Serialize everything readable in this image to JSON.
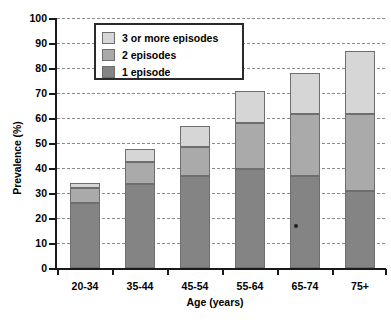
{
  "chart_data": {
    "type": "bar",
    "stacked": true,
    "title": "",
    "xlabel": "Age (years)",
    "ylabel": "Prevalence (%)",
    "categories": [
      "20-34",
      "35-44",
      "45-54",
      "55-64",
      "65-74",
      "75+"
    ],
    "ylim": [
      0,
      100
    ],
    "yticks": [
      0,
      10,
      20,
      30,
      40,
      50,
      60,
      70,
      80,
      90,
      100
    ],
    "grid": true,
    "legend_position": "top-left-inside",
    "series": [
      {
        "name": "1 episode",
        "color": "#848484",
        "values": [
          26.0,
          33.5,
          37.0,
          39.5,
          37.0,
          31.0
        ]
      },
      {
        "name": "2 episodes",
        "color": "#aaaaaa",
        "values": [
          6.0,
          9.0,
          11.5,
          18.5,
          24.5,
          30.5
        ]
      },
      {
        "name": "3 or more episodes",
        "color": "#d6d6d6",
        "values": [
          2.0,
          5.0,
          8.5,
          13.0,
          16.5,
          25.5
        ]
      }
    ],
    "totals": [
      34.0,
      47.5,
      57.0,
      71.0,
      78.0,
      87.0
    ]
  },
  "axes": {
    "ylabel": "Prevalence (%)",
    "xlabel": "Age (years)",
    "ytick_labels": [
      "100",
      "90",
      "80",
      "70",
      "60",
      "50",
      "40",
      "30",
      "20",
      "10",
      "0"
    ],
    "xtick_labels": [
      "20-34",
      "35-44",
      "45-54",
      "55-64",
      "65-74",
      "75+"
    ]
  },
  "legend": {
    "items": [
      {
        "label": "3 or more episodes",
        "color": "#d6d6d6"
      },
      {
        "label": "2 episodes",
        "color": "#aaaaaa"
      },
      {
        "label": "1 episode",
        "color": "#848484"
      }
    ]
  }
}
